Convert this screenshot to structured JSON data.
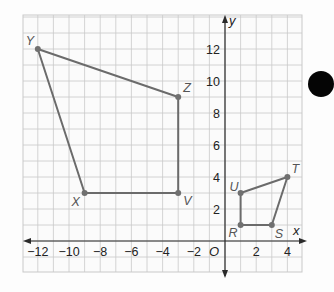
{
  "figure": {
    "axes": {
      "x_label": "x",
      "y_label": "y",
      "origin_label": "O",
      "x_ticks": [
        -12,
        -10,
        -8,
        -6,
        -4,
        -2,
        2,
        4
      ],
      "y_ticks": [
        2,
        4,
        6,
        8,
        10,
        12
      ],
      "x_range": [
        -13,
        5
      ],
      "y_range": [
        -2,
        14
      ],
      "grid": true
    },
    "polygons": [
      {
        "name": "XYZV",
        "vertices": [
          {
            "label": "Y",
            "x": -12,
            "y": 12
          },
          {
            "label": "Z",
            "x": -3,
            "y": 9
          },
          {
            "label": "V",
            "x": -3,
            "y": 3
          },
          {
            "label": "X",
            "x": -9,
            "y": 3
          }
        ]
      },
      {
        "name": "RSTU",
        "vertices": [
          {
            "label": "U",
            "x": 1,
            "y": 3
          },
          {
            "label": "T",
            "x": 4,
            "y": 4
          },
          {
            "label": "S",
            "x": 3,
            "y": 1
          },
          {
            "label": "R",
            "x": 1,
            "y": 1
          }
        ]
      }
    ],
    "colors": {
      "grid": "#c9c9c9",
      "axis": "#2a2a2a",
      "polygon": "#6b6b6b",
      "vertex": "#707070",
      "label": "#555555",
      "tick_label": "#222222",
      "marker": "#050505"
    }
  }
}
